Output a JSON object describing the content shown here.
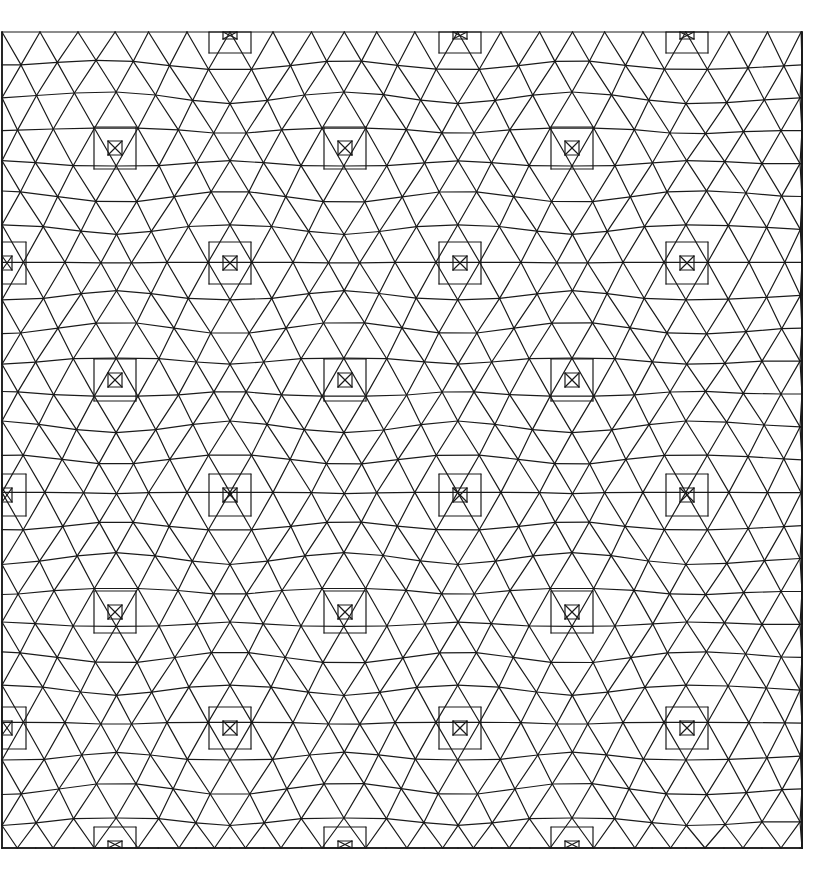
{
  "figure": {
    "stroke_color": "#1a1a1a",
    "background": "#ffffff",
    "bounds": {
      "x0": 2,
      "y0": 32,
      "x1": 802,
      "y1": 848
    },
    "square_centers": [
      [
        115,
        148
      ],
      [
        345,
        148
      ],
      [
        572,
        148
      ],
      [
        230,
        263
      ],
      [
        460,
        263
      ],
      [
        687,
        263
      ],
      [
        5,
        263
      ],
      [
        115,
        380
      ],
      [
        345,
        380
      ],
      [
        572,
        380
      ],
      [
        230,
        495
      ],
      [
        460,
        495
      ],
      [
        687,
        495
      ],
      [
        5,
        495
      ],
      [
        115,
        612
      ],
      [
        345,
        612
      ],
      [
        572,
        612
      ],
      [
        230,
        728
      ],
      [
        460,
        728
      ],
      [
        687,
        728
      ],
      [
        5,
        728
      ],
      [
        230,
        32
      ],
      [
        460,
        32
      ],
      [
        687,
        32
      ],
      [
        115,
        848
      ],
      [
        345,
        848
      ],
      [
        572,
        848
      ]
    ],
    "square_sizes": [
      14,
      42
    ],
    "mesh_spacing": 38
  }
}
